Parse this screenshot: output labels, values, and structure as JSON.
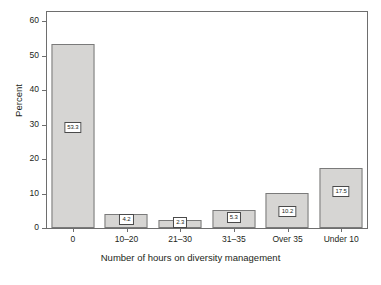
{
  "chart_data": {
    "type": "bar",
    "title": "",
    "subtitle": "",
    "xlabel": "Number of hours on diversity management",
    "ylabel": "Percent",
    "categories": [
      "0",
      "10–20",
      "21–30",
      "31–35",
      "Over 35",
      "Under 10"
    ],
    "values": [
      53.3,
      4.2,
      2.3,
      5.3,
      10.2,
      17.5
    ],
    "data_labels": [
      "53.3",
      "4.2",
      "2.3",
      "5.3",
      "10.2",
      "17.5"
    ],
    "ylim": [
      0,
      63
    ],
    "yticks": [
      0,
      10,
      20,
      30,
      40,
      50,
      60
    ],
    "ytick_labels": [
      "0",
      "10",
      "20",
      "30",
      "40",
      "50",
      "60"
    ],
    "grid": false,
    "legend": false,
    "legend_position": "none",
    "bar_fill_color": "#d6d5d3",
    "bar_border_color": "#7a7a7a",
    "axis_color": "#6e6e6e",
    "text_color": "#231f20",
    "label_box_background": "#ffffff",
    "label_box_border_color": "#4a4a4a"
  }
}
